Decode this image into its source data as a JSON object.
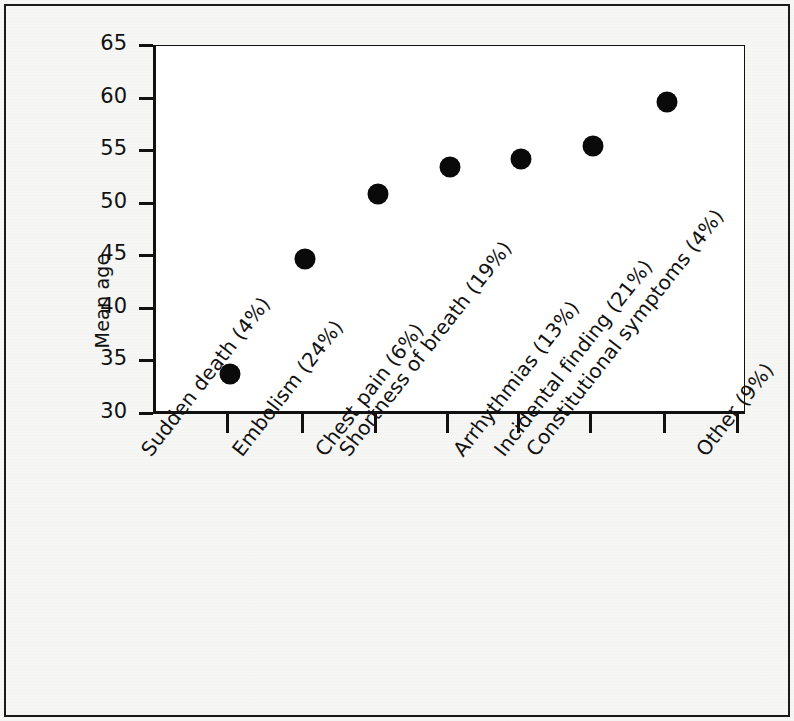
{
  "chart_data": {
    "type": "scatter",
    "title": "",
    "xlabel": "",
    "ylabel": "Mean age",
    "ylim": [
      30,
      65
    ],
    "yticks": [
      30,
      35,
      40,
      45,
      50,
      55,
      60,
      65
    ],
    "grid": false,
    "legend": "none",
    "marker": "filled-circle",
    "marker_color": "#0a0a0a",
    "categories": [
      "Sudden death (4%)",
      "Embolism (24%)",
      "Chest pain (6%)",
      "Shortness of breath (19%)",
      "Arrhythmias (13%)",
      "Incidental finding (21%)",
      "Constitutional symptoms (4%)",
      "Other (9%)"
    ],
    "values": [
      33.8,
      44.7,
      50.9,
      53.5,
      54.3,
      55.5,
      59.7,
      null
    ]
  },
  "figure": {
    "background_color": "#f6f6f4",
    "panel_color": "#ffffff",
    "border_color": "#1a1a1a"
  }
}
